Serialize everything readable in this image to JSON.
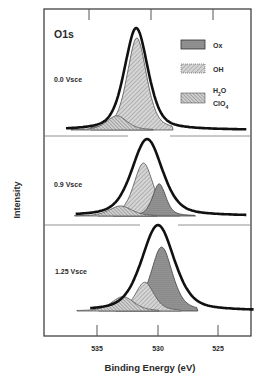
{
  "chart_data": {
    "type": "area",
    "title": "O1s",
    "xlabel": "Binding Energy (eV)",
    "ylabel": "Intensity",
    "xlim": [
      537,
      523
    ],
    "x_reversed": true,
    "xticks": [
      535,
      530,
      525
    ],
    "xtick_labels": [
      "535",
      "530",
      "525"
    ],
    "grid": false,
    "legend": {
      "position": "upper right (top panel)",
      "entries": [
        {
          "key": "Ox",
          "label": "Ox",
          "fill": "#8c8c8c",
          "pattern": "solid-dark"
        },
        {
          "key": "OH",
          "label": "OH",
          "fill": "#c8c8c8",
          "pattern": "fine-hatch"
        },
        {
          "key": "H2O",
          "label": "H2O / ClO4",
          "fill": "#bdbdbd",
          "pattern": "dense-hatch"
        }
      ]
    },
    "panels": [
      {
        "label": "0.0 Vsce",
        "envelope": {
          "center": 531.8,
          "height": 1.0,
          "fwhm": 2.3
        },
        "components": [
          {
            "name": "OH",
            "center": 531.75,
            "height": 0.97,
            "fwhm": 1.9
          },
          {
            "name": "H2O",
            "center": 533.4,
            "height": 0.15,
            "fwhm": 2.0
          }
        ]
      },
      {
        "label": "0.9 Vsce",
        "envelope": {
          "center": 530.9,
          "height": 1.0,
          "fwhm": 3.0
        },
        "components": [
          {
            "name": "OH",
            "center": 531.2,
            "height": 0.74,
            "fwhm": 1.9
          },
          {
            "name": "Ox",
            "center": 529.9,
            "height": 0.45,
            "fwhm": 1.3
          },
          {
            "name": "H2O",
            "center": 533.1,
            "height": 0.14,
            "fwhm": 2.2
          }
        ]
      },
      {
        "label": "1.25 Vsce",
        "envelope": {
          "center": 530.0,
          "height": 1.0,
          "fwhm": 3.2
        },
        "components": [
          {
            "name": "Ox",
            "center": 529.7,
            "height": 0.8,
            "fwhm": 2.1
          },
          {
            "name": "OH",
            "center": 531.1,
            "height": 0.36,
            "fwhm": 1.8
          },
          {
            "name": "H2O",
            "center": 532.9,
            "height": 0.18,
            "fwhm": 2.2
          }
        ]
      }
    ]
  },
  "labels": {
    "title": "O1s",
    "ylabel": "Intensity",
    "xlabel": "Binding Energy (eV)",
    "panel_1": "0.0 Vsce",
    "panel_2": "0.9 Vsce",
    "panel_3": "1.25 Vsce",
    "tick_535": "535",
    "tick_530": "530",
    "tick_525": "525",
    "legend_ox": "Ox",
    "legend_oh": "OH",
    "legend_h2o_h": "H",
    "legend_h2o_2": "2",
    "legend_h2o_o": "O",
    "legend_clo4_clo": "ClO",
    "legend_clo4_4": "4"
  }
}
